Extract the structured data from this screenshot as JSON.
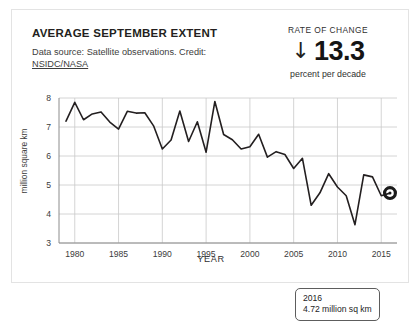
{
  "header": {
    "title": "AVERAGE SEPTEMBER EXTENT",
    "subtitle_line1": "Data source: Satellite observations. Credit:",
    "subtitle_credit": "NSIDC/NASA",
    "rate_caption": "RATE OF CHANGE",
    "rate_arrow": "↓",
    "rate_value": "13.3",
    "rate_units": "percent per decade"
  },
  "tooltip": {
    "year": "2016",
    "value": "4.72 million sq km"
  },
  "colors": {
    "line": "#231f20",
    "grid": "#c9c9c9",
    "axis": "#8c8c8c",
    "text": "#231f20",
    "card_border": "#e3e3e3",
    "marker": "#1a1a1a",
    "background": "#ffffff"
  },
  "chart_data": {
    "type": "line",
    "title": "AVERAGE SEPTEMBER EXTENT",
    "xlabel": "YEAR",
    "ylabel": "million square km",
    "xlim": [
      1978.2,
      2016.8
    ],
    "ylim": [
      3,
      8
    ],
    "xticks": [
      1980,
      1985,
      1990,
      1995,
      2000,
      2005,
      2010,
      2015
    ],
    "yticks": [
      3,
      4,
      5,
      6,
      7,
      8
    ],
    "grid": true,
    "legend": "none",
    "highlight_point": {
      "x": 2016,
      "y": 4.72,
      "marker": "ring"
    },
    "annotation": "2016 — 4.72 million sq km",
    "series": [
      {
        "name": "September Arctic sea ice extent",
        "x": [
          1979,
          1980,
          1981,
          1982,
          1983,
          1984,
          1985,
          1986,
          1987,
          1988,
          1989,
          1990,
          1991,
          1992,
          1993,
          1994,
          1995,
          1996,
          1997,
          1998,
          1999,
          2000,
          2001,
          2002,
          2003,
          2004,
          2005,
          2006,
          2007,
          2008,
          2009,
          2010,
          2011,
          2012,
          2013,
          2014,
          2015,
          2016
        ],
        "values": [
          7.2,
          7.85,
          7.25,
          7.45,
          7.52,
          7.17,
          6.93,
          7.54,
          7.48,
          7.49,
          7.04,
          6.24,
          6.55,
          7.55,
          6.5,
          7.18,
          6.13,
          7.88,
          6.74,
          6.56,
          6.24,
          6.32,
          6.75,
          5.96,
          6.15,
          6.05,
          5.57,
          5.92,
          4.3,
          4.73,
          5.39,
          4.93,
          4.63,
          3.63,
          5.35,
          5.28,
          4.63,
          4.72
        ]
      }
    ]
  }
}
